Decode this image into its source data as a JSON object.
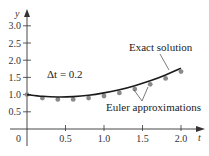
{
  "chart_data": {
    "type": "line",
    "title": "",
    "xlabel": "t",
    "ylabel": "y",
    "xlim": [
      0,
      2.2
    ],
    "ylim": [
      0,
      3.2
    ],
    "x_ticks": [
      0.5,
      1.0,
      1.5,
      2.0
    ],
    "x_tick_labels": [
      "0.5",
      "1.0",
      "1.5",
      "2.0"
    ],
    "y_ticks": [
      0.5,
      1.0,
      1.5,
      2.0,
      2.5,
      3.0
    ],
    "y_tick_labels": [
      "0.5",
      "1.0",
      "1.5",
      "2.0",
      "2.5",
      "3.0"
    ],
    "origin_label": "0",
    "grid": false,
    "legend": null,
    "annotations": [
      {
        "text": "Δt = 0.2",
        "x": 0.55,
        "y": 1.5
      },
      {
        "text": "Exact solution",
        "points_to": "exact curve near t=1.85"
      },
      {
        "text": "Euler approximations",
        "points_to": "Euler points near t=1.4 and t=1.6"
      }
    ],
    "series": [
      {
        "name": "Exact solution",
        "type": "line",
        "x": [
          0,
          0.2,
          0.4,
          0.6,
          0.8,
          1.0,
          1.2,
          1.4,
          1.6,
          1.8,
          2.0
        ],
        "values": [
          1.0,
          0.95,
          0.93,
          0.94,
          0.98,
          1.05,
          1.14,
          1.26,
          1.4,
          1.57,
          1.77
        ]
      },
      {
        "name": "Euler approximations",
        "type": "scatter",
        "x": [
          0,
          0.2,
          0.4,
          0.6,
          0.8,
          1.0,
          1.2,
          1.4,
          1.6,
          1.8,
          2.0
        ],
        "values": [
          1.0,
          0.9,
          0.86,
          0.86,
          0.9,
          0.96,
          1.05,
          1.16,
          1.3,
          1.47,
          1.67
        ]
      }
    ]
  },
  "labels": {
    "y_axis": "y",
    "x_axis": "t",
    "origin": "0",
    "delta": "Δt = 0.2",
    "exact": "Exact solution",
    "euler": "Euler approximations"
  }
}
